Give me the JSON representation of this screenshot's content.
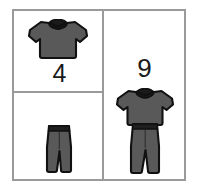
{
  "page": {
    "background_color": "#ffffff",
    "border_color": "#9a9a9a"
  },
  "colors": {
    "garment_fill": "#595959",
    "garment_outline": "#111111",
    "collar_fill": "#1a1a1a",
    "waistband_fill": "#1f1f1f",
    "number_text": "#1a1a1a",
    "grid_line": "#9a9a9a",
    "background": "#ffffff"
  },
  "grid": {
    "columns": 2,
    "rows": 2,
    "cells": [
      {
        "position": "top-left",
        "icon": "t-shirt-icon",
        "icon_label": "t-shirt",
        "number": "4",
        "has_number": true
      },
      {
        "position": "bottom-left",
        "icon": "pants-icon",
        "icon_label": "pants",
        "number": "",
        "has_number": false
      },
      {
        "position": "right",
        "icon": "outfit-icon",
        "icon_label": "t-shirt and pants outfit",
        "number": "9",
        "has_number": true
      }
    ]
  }
}
